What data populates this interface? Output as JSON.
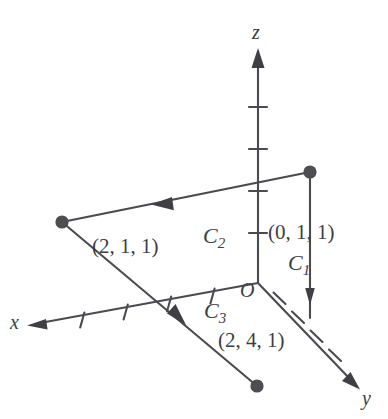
{
  "figure": {
    "background_color": "#ffffff",
    "stroke_color": "#4a4a50",
    "text_color": "#3d3d42"
  },
  "axes": {
    "x": {
      "label": "x",
      "arrow": "left",
      "ticks": 4
    },
    "y": {
      "label": "y",
      "arrow": "down-right",
      "ticks": 4
    },
    "z": {
      "label": "z",
      "arrow": "up",
      "ticks": 4
    }
  },
  "origin": {
    "label": "O"
  },
  "points": [
    {
      "name": "point-0-1-1",
      "label": "(0, 1, 1)"
    },
    {
      "name": "point-2-1-1",
      "label": "(2, 1, 1)"
    },
    {
      "name": "point-2-4-1",
      "label": "(2, 4, 1)"
    }
  ],
  "curves": [
    {
      "name": "curve-c1",
      "label": "C",
      "subscript": "1"
    },
    {
      "name": "curve-c2",
      "label": "C",
      "subscript": "2"
    },
    {
      "name": "curve-c3",
      "label": "C",
      "subscript": "3"
    }
  ]
}
